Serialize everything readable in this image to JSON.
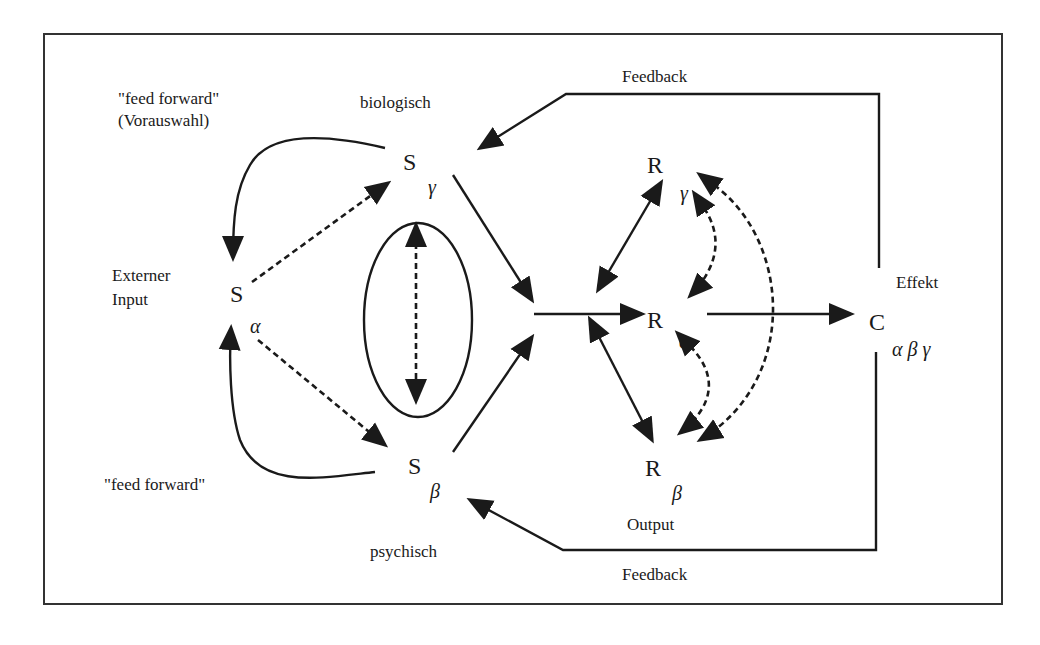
{
  "diagram": {
    "labels": {
      "feed_forward_top": "\"feed forward\"",
      "vorauswahl": "(Vorauswahl)",
      "biologisch": "biologisch",
      "externer": "Externer",
      "input": "Input",
      "feed_forward_bottom": "\"feed forward\"",
      "psychisch": "psychisch",
      "feedback_top": "Feedback",
      "feedback_bottom": "Feedback",
      "effekt": "Effekt",
      "output": "Output"
    },
    "nodes": {
      "s_alpha": {
        "main": "S",
        "sub": "α"
      },
      "s_gamma": {
        "main": "S",
        "sub": "γ"
      },
      "s_beta": {
        "main": "S",
        "sub": "β"
      },
      "r_gamma": {
        "main": "R",
        "sub": "γ"
      },
      "r_alpha": {
        "main": "R",
        "sub": "α"
      },
      "r_beta": {
        "main": "R",
        "sub": "β"
      },
      "c": {
        "main": "C",
        "sub": "α β γ"
      }
    },
    "colors": {
      "ink": "#1a1a1a",
      "background": "#ffffff",
      "frame": "#333333"
    }
  }
}
